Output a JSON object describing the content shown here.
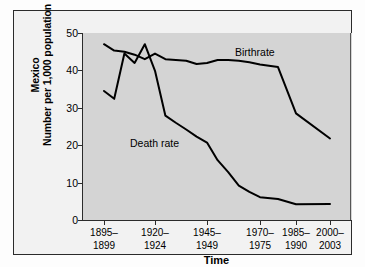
{
  "chart_data": {
    "type": "line",
    "title": "",
    "subtitle": "",
    "region": "Mexico",
    "ylabel_line1": "Mexico",
    "ylabel_line2": "Number per 1,000 population",
    "xlabel": "Time",
    "ylim": [
      0,
      50
    ],
    "yticks": [
      0,
      10,
      20,
      30,
      40,
      50
    ],
    "grid": false,
    "legend_position": "inline-annotations",
    "categories": [
      "1895–1899",
      "1900–1904",
      "1905–1909",
      "1910–1914",
      "1915–1919",
      "1920–1924",
      "1925–1929",
      "1930–1934",
      "1935–1939",
      "1940–1944",
      "1945–1949",
      "1950–1954",
      "1955–1959",
      "1960–1964",
      "1965–1969",
      "1970–1975",
      "1976–1980",
      "1985–1990",
      "2000–2003"
    ],
    "tick_labels": [
      {
        "line1": "1895–",
        "line2": "1899"
      },
      {
        "line1": "1920–",
        "line2": "1924"
      },
      {
        "line1": "1945–",
        "line2": "1949"
      },
      {
        "line1": "1970–",
        "line2": "1975"
      },
      {
        "line1": "1985–",
        "line2": "1990"
      },
      {
        "line1": "2000–",
        "line2": "2003"
      }
    ],
    "series": [
      {
        "name": "Birthrate",
        "label": "Birthrate",
        "color": "#000000",
        "values": [
          47.0,
          45.3,
          45.0,
          44.2,
          43.0,
          44.5,
          43.0,
          42.8,
          42.6,
          41.7,
          42.0,
          42.8,
          42.8,
          42.6,
          42.2,
          41.6,
          40.9,
          28.5,
          21.8
        ]
      },
      {
        "name": "Death rate",
        "label": "Death rate",
        "color": "#000000",
        "values": [
          34.5,
          32.4,
          44.5,
          42.0,
          47.0,
          39.9,
          27.9,
          26.0,
          24.2,
          22.3,
          20.7,
          16.0,
          12.8,
          9.2,
          7.5,
          6.1,
          5.6,
          4.2,
          4.3
        ]
      }
    ]
  },
  "annotations": {
    "birthrate_label": "Birthrate",
    "deathrate_label": "Death rate"
  }
}
